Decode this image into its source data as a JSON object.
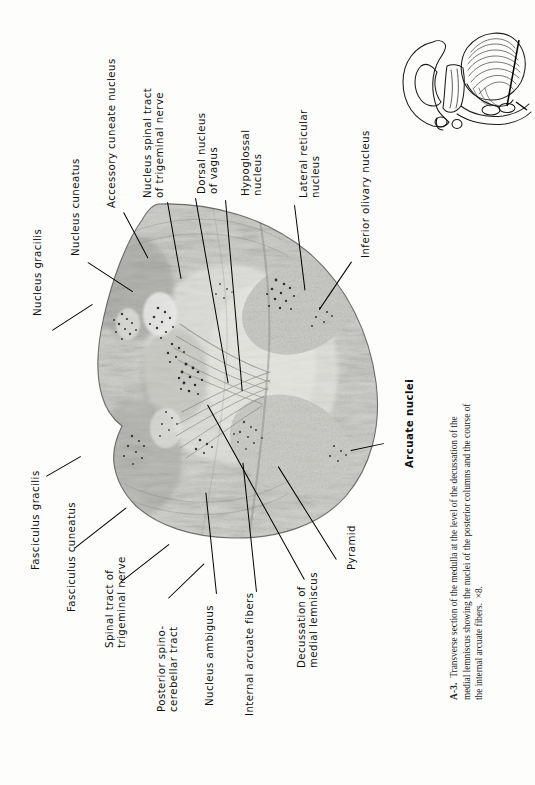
{
  "figure": {
    "number": "A-3.",
    "caption_line1": "Transverse section of the medulla at the level of the decussation of the",
    "caption_line2": "medial lemniscus showing the nuclei of the posterior columns and the course of the",
    "caption_line3": "internal arcuate fibers.",
    "magnification": "×8.",
    "full_caption": "A-3.  Transverse section of the medulla at the level of the decussation of the medial lemniscus showing the nuclei of the posterior columns and the course of the internal arcuate fibers.  ×8."
  },
  "labels": {
    "nucleus_gracilis": "Nucleus gracilis",
    "nucleus_cuneatus": "Nucleus cuneatus",
    "accessory_cuneate_nucleus": "Accessory cuneate nucleus",
    "nucleus_spinal_tract_trigeminal": "Nucleus spinal tract\nof trigeminal nerve",
    "dorsal_nucleus_vagus": "Dorsal nucleus\nof vagus",
    "hypoglossal_nucleus": "Hypoglossal\nnucleus",
    "lateral_reticular_nucleus": "Lateral reticular\nnucleus",
    "inferior_olivary_nucleus": "Inferior olivary nucleus",
    "arcuate_nuclei": "Arcuate nuclei",
    "fasciculus_gracilis": "Fasciculus gracilis",
    "fasciculus_cuneatus": "Fasciculus cuneatus",
    "spinal_tract_trigeminal": "Spinal tract of\ntrigeminal nerve",
    "posterior_spinocerebellar_tract": "Posterior spino-\ncerebellar tract",
    "nucleus_ambiguus": "Nucleus ambiguus",
    "internal_arcuate_fibers": "Internal arcuate fibers",
    "decussation_medial_lemniscus": "Decussation of\nmedial lemniscus",
    "pyramid": "Pyramid"
  },
  "image": {
    "specimen_name": "medulla-transverse-section-photomicrograph",
    "inset_name": "brainstem-cerebellum-orientation-inset",
    "section_plane_name": "section-plane-line"
  },
  "colors": {
    "background": "#fdfdfb",
    "ink": "#111111",
    "tissue_dark": "#8d8d8d",
    "tissue_mid": "#b4b4b2",
    "tissue_light": "#d8d8d4"
  }
}
